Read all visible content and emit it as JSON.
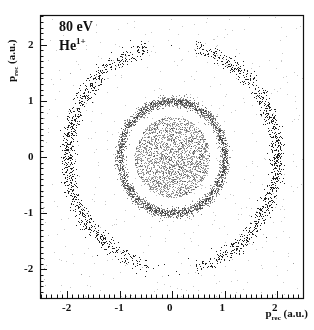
{
  "chart_data": {
    "type": "scatter",
    "title": "",
    "annotation": {
      "energy": "80 eV",
      "ion": "He",
      "charge": "1+"
    },
    "xlabel": {
      "main": "p",
      "sub": "rec",
      "unit": "(a.u.)"
    },
    "ylabel": {
      "main": "p",
      "sub": "rec",
      "unit": "(a.u.)"
    },
    "xlim": [
      -2.5,
      2.5
    ],
    "ylim": [
      -2.5,
      2.5
    ],
    "x_ticks": [
      -2,
      -1,
      0,
      1,
      2
    ],
    "y_ticks": [
      -2,
      -1,
      0,
      1,
      2
    ],
    "x_tick_labels": [
      "-2",
      "-1",
      "0",
      "1",
      "2"
    ],
    "y_tick_labels": [
      "-2",
      "-1",
      "0",
      "1",
      "2"
    ],
    "grid": false,
    "legend": null,
    "structures": [
      {
        "name": "outer ring",
        "radius": 2.0,
        "width": 0.12,
        "gaps_near_y_axis": true,
        "gap_halfwidth_x": 0.45,
        "density": "high"
      },
      {
        "name": "middle ring",
        "radius": 1.0,
        "width": 0.08,
        "density": "medium"
      },
      {
        "name": "inner disk",
        "radius": 0.7,
        "density": "low"
      }
    ],
    "point_color": "#222222"
  }
}
